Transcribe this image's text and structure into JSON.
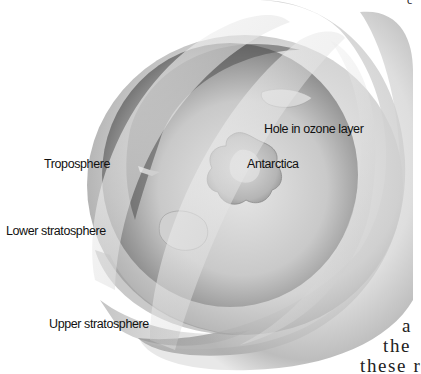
{
  "figure": {
    "labels": {
      "hole": "Hole in ozone layer",
      "antarctica": "Antarctica",
      "troposphere": "Troposphere",
      "lower_stratosphere": "Lower stratosphere",
      "upper_stratosphere": "Upper stratosphere"
    },
    "colors": {
      "background": "#ffffff",
      "shell_light": "#f2f2f2",
      "shell_mid": "#c4c4c4",
      "shell_dark": "#6e6e6e",
      "label_text": "#111111"
    }
  },
  "page_text": {
    "line1": "a",
    "line2": "the",
    "line3": "these r",
    "corner_fragment": "c"
  }
}
